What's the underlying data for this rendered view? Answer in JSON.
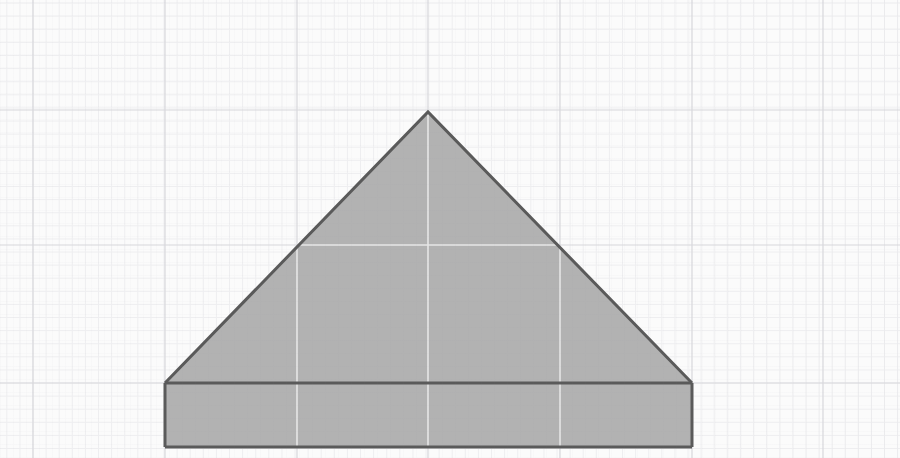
{
  "canvas": {
    "width": 900,
    "height": 458,
    "background_color": "#fbfbfb",
    "description": "Scanned graph-paper sheet showing a shaded triangle resting on a shaded rectangular base"
  },
  "grid": {
    "major_color": "#d8d8dc",
    "minor_color": "#eeeef0",
    "major_spacing": 131.5,
    "minor_spacing": 13.1,
    "vertical_major_x": [
      33,
      165,
      297,
      428,
      560,
      692,
      823
    ],
    "horizontal_major_y": [
      110,
      245,
      383
    ],
    "grid_on": true,
    "interior_grid_color": "#e6e6e6"
  },
  "figure": {
    "name": "triangle-on-rectangle",
    "fill_color": "#b2b2b2",
    "stroke_color": "#5a5a5a",
    "stroke_width": 3,
    "triangle": {
      "label": "triangle",
      "apex": {
        "x": 428,
        "y": 112
      },
      "base_left": {
        "x": 165,
        "y": 383
      },
      "base_right": {
        "x": 692,
        "y": 383
      },
      "base_width": 527,
      "height": 271
    },
    "rectangle": {
      "label": "rectangle-base",
      "left": 165,
      "right": 692,
      "top": 383,
      "bottom": 447,
      "width": 527,
      "height": 64
    }
  },
  "annotations": {
    "labels": [],
    "text": []
  }
}
